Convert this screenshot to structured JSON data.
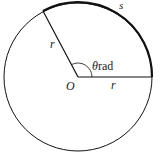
{
  "diagram": {
    "title": "",
    "center_label": "O",
    "radius_label_slanted": "r",
    "radius_label_horizontal": "r",
    "arc_label": "s",
    "angle_symbol": "θ",
    "angle_unit": "rad",
    "colors": {
      "stroke": "#111111",
      "background": "#ffffff"
    }
  }
}
